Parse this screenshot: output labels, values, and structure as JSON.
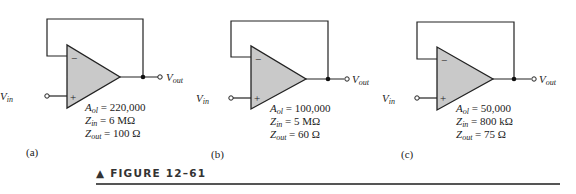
{
  "figure": {
    "caption_marker": "▲",
    "caption": "FIGURE 12–61"
  },
  "colors": {
    "opamp_fill": "#c9c9c9",
    "line": "#222222",
    "rule": "#555555"
  },
  "circuits": [
    {
      "label": "(a)",
      "input_label": "V",
      "input_sub": "in",
      "output_label": "V",
      "output_sub": "out",
      "minus": "−",
      "plus": "+",
      "aol_label": "A",
      "aol_sub": "ol",
      "aol_value": " = 220,000",
      "zin_label": "Z",
      "zin_sub": "in",
      "zin_value": " = 6 MΩ",
      "zout_label": "Z",
      "zout_sub": "out",
      "zout_value": " = 100 Ω"
    },
    {
      "label": "(b)",
      "input_label": "V",
      "input_sub": "in",
      "output_label": "V",
      "output_sub": "out",
      "minus": "−",
      "plus": "+",
      "aol_label": "A",
      "aol_sub": "ol",
      "aol_value": " = 100,000",
      "zin_label": "Z",
      "zin_sub": "in",
      "zin_value": " = 5 MΩ",
      "zout_label": "Z",
      "zout_sub": "out",
      "zout_value": " = 60 Ω"
    },
    {
      "label": "(c)",
      "input_label": "V",
      "input_sub": "in",
      "output_label": "V",
      "output_sub": "out",
      "minus": "−",
      "plus": "+",
      "aol_label": "A",
      "aol_sub": "ol",
      "aol_value": " = 50,000",
      "zin_label": "Z",
      "zin_sub": "in",
      "zin_value": " = 800 kΩ",
      "zout_label": "Z",
      "zout_sub": "out",
      "zout_value": " = 75 Ω"
    }
  ]
}
